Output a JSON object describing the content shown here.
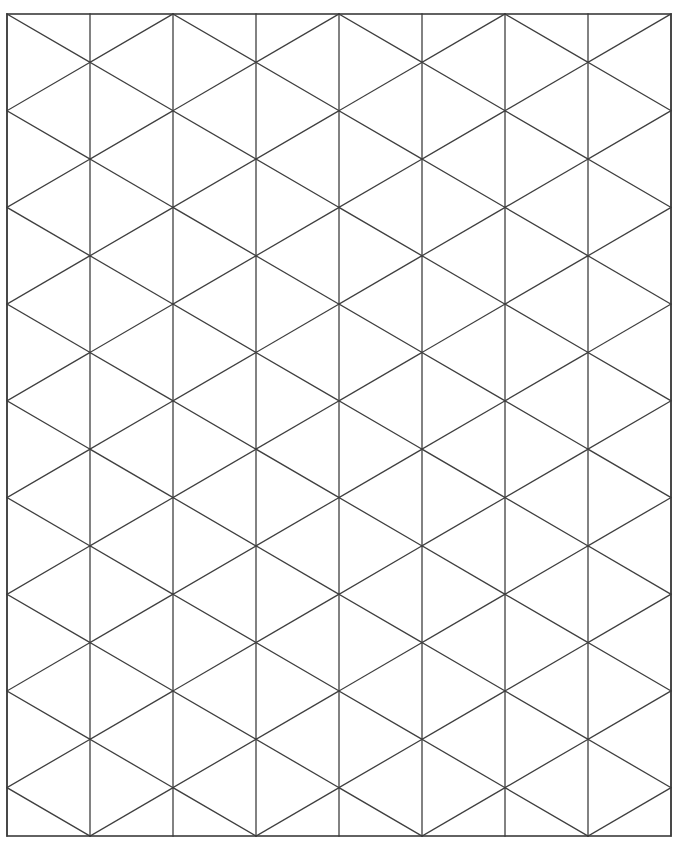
{
  "figure": {
    "kind": "isometric-triangular-grid",
    "canvas": {
      "width": 681,
      "height": 851,
      "background_color": "#ffffff"
    },
    "frame": {
      "left": 7,
      "top": 14,
      "right": 671,
      "bottom": 836,
      "width": 664,
      "height": 822,
      "stroke_color": "#3b3b3b",
      "stroke_width": 1.6
    },
    "lattice": {
      "vertical_line_count": 9,
      "vertical_spacing": 83.0,
      "vertical_x_positions": [
        7,
        90,
        173,
        256,
        339,
        422,
        505,
        588,
        671
      ],
      "row_count": 17,
      "row_spacing": 48.35,
      "row_y_positions": [
        14,
        62.35,
        110.7,
        159.06,
        207.41,
        255.76,
        304.12,
        352.47,
        400.82,
        449.18,
        497.53,
        545.88,
        594.24,
        642.59,
        690.94,
        739.29,
        787.65,
        836
      ],
      "stroke_color": "#3f3f3f",
      "stroke_width": 1.3,
      "diagonal_direction_count": 2,
      "triangle_orientation": "alternating-left-right",
      "grid_on": true
    },
    "labels": {
      "axis_labels": [],
      "tick_labels": [],
      "legend_entries": [],
      "annotations": []
    }
  }
}
